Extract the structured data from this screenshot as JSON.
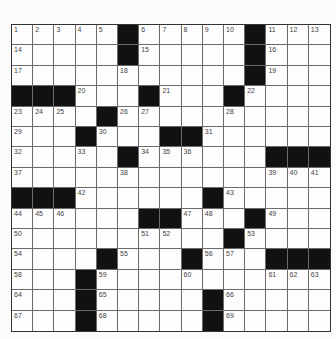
{
  "puzzle": {
    "rows": 15,
    "cols": 15,
    "layout": [
      "1,2,3,4,5,#,6,7,8,9,10,#,11,12,13",
      "14,.,.,.,.,#,15,.,.,.,.,#,16,.,.",
      "17,.,.,.,.,18,.,.,.,.,.,#,19,.,.",
      "#,#,#,20,.,.,#,21,.,.,#,22,.,.,.",
      "23,24,25,.,#,26,27,.,.,.,28,.,.,.,.",
      "29,.,.,#,30,.,.,#,#,31,.,.,.,.,.",
      "32,.,.,33,.,#,34,35,36,.,.,.,#,#,#",
      "37,.,.,.,.,38,.,.,.,.,.,.,39,40,41",
      "#,#,#,42,.,.,.,.,.,#,43,.,.,.,.",
      "44,45,46,.,.,.,#,#,47,48,.,#,49,.,.",
      "50,.,.,.,.,.,51,52,.,.,#,53,.,.,.",
      "54,.,.,.,#,55,.,.,#,56,57,.,#,#,#",
      "58,.,.,#,59,.,.,.,60,.,.,.,61,62,63",
      "64,.,.,#,65,.,.,.,.,#,66,.,.,.,.",
      "67,.,.,#,68,.,.,.,.,#,69,.,.,.,."
    ],
    "colors": {
      "block": "#111111",
      "cell": "#fdfdfd",
      "gridline": "#6a6a6a",
      "number": "#444444"
    }
  }
}
